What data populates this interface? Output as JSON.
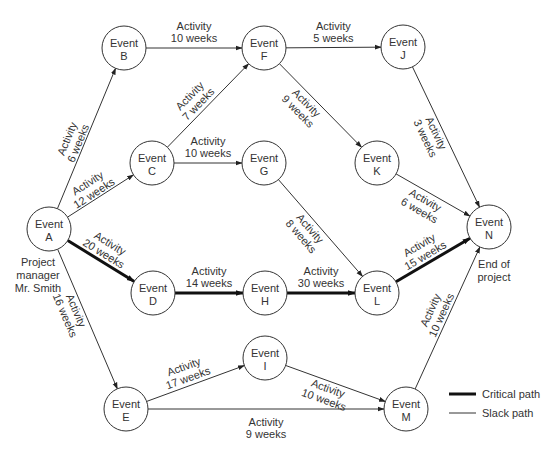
{
  "diagram": {
    "type": "PERT network",
    "colors": {
      "line": "#333333",
      "critical": "#111111",
      "background": "#ffffff"
    },
    "nodes": [
      {
        "id": "A",
        "line1": "Event",
        "line2": "A",
        "x": 49,
        "y": 229
      },
      {
        "id": "B",
        "line1": "Event",
        "line2": "B",
        "x": 124,
        "y": 48
      },
      {
        "id": "C",
        "line1": "Event",
        "line2": "C",
        "x": 152,
        "y": 163
      },
      {
        "id": "D",
        "line1": "Event",
        "line2": "D",
        "x": 153,
        "y": 293
      },
      {
        "id": "E",
        "line1": "Event",
        "line2": "E",
        "x": 126,
        "y": 409
      },
      {
        "id": "F",
        "line1": "Event",
        "line2": "F",
        "x": 264,
        "y": 48
      },
      {
        "id": "G",
        "line1": "Event",
        "line2": "G",
        "x": 264,
        "y": 163
      },
      {
        "id": "H",
        "line1": "Event",
        "line2": "H",
        "x": 265,
        "y": 293
      },
      {
        "id": "I",
        "line1": "Event",
        "line2": "I",
        "x": 265,
        "y": 358
      },
      {
        "id": "J",
        "line1": "Event",
        "line2": "J",
        "x": 403,
        "y": 47
      },
      {
        "id": "K",
        "line1": "Event",
        "line2": "K",
        "x": 377,
        "y": 163
      },
      {
        "id": "L",
        "line1": "Event",
        "line2": "L",
        "x": 377,
        "y": 293
      },
      {
        "id": "M",
        "line1": "Event",
        "line2": "M",
        "x": 406,
        "y": 409
      },
      {
        "id": "N",
        "line1": "Event",
        "line2": "N",
        "x": 489,
        "y": 227
      }
    ],
    "edges": [
      {
        "from": "A",
        "to": "B",
        "line1": "Activity",
        "line2": "6 weeks",
        "critical": false
      },
      {
        "from": "A",
        "to": "C",
        "line1": "Activity",
        "line2": "12 weeks",
        "critical": false
      },
      {
        "from": "A",
        "to": "D",
        "line1": "Activity",
        "line2": "20 weeks",
        "critical": true
      },
      {
        "from": "A",
        "to": "E",
        "line1": "Activity",
        "line2": "16 weeks",
        "critical": false
      },
      {
        "from": "B",
        "to": "F",
        "line1": "Activity",
        "line2": "10 weeks",
        "critical": false
      },
      {
        "from": "C",
        "to": "F",
        "line1": "Activity",
        "line2": "7 weeks",
        "critical": false
      },
      {
        "from": "C",
        "to": "G",
        "line1": "Activity",
        "line2": "10 weeks",
        "critical": false
      },
      {
        "from": "D",
        "to": "H",
        "line1": "Activity",
        "line2": "14 weeks",
        "critical": true
      },
      {
        "from": "E",
        "to": "I",
        "line1": "Activity",
        "line2": "17 weeks",
        "critical": false
      },
      {
        "from": "E",
        "to": "M",
        "line1": "Activity",
        "line2": "9 weeks",
        "critical": false
      },
      {
        "from": "F",
        "to": "J",
        "line1": "Activity",
        "line2": "5 weeks",
        "critical": false
      },
      {
        "from": "F",
        "to": "K",
        "line1": "Activity",
        "line2": "9 weeks",
        "critical": false
      },
      {
        "from": "G",
        "to": "L",
        "line1": "Activity",
        "line2": "8 weeks",
        "critical": false
      },
      {
        "from": "H",
        "to": "L",
        "line1": "Activity",
        "line2": "30 weeks",
        "critical": true
      },
      {
        "from": "I",
        "to": "M",
        "line1": "Activity",
        "line2": "10 weeks",
        "critical": false
      },
      {
        "from": "J",
        "to": "N",
        "line1": "Activity",
        "line2": "3 weeks",
        "critical": false
      },
      {
        "from": "K",
        "to": "N",
        "line1": "Activity",
        "line2": "6 weeks",
        "critical": false
      },
      {
        "from": "L",
        "to": "N",
        "line1": "Activity",
        "line2": "15 weeks",
        "critical": true
      },
      {
        "from": "M",
        "to": "N",
        "line1": "Activity",
        "line2": "10 weeks",
        "critical": false
      }
    ],
    "notes": {
      "start": {
        "line1": "Project",
        "line2": "manager",
        "line3": "Mr. Smith"
      },
      "end": {
        "line1": "End of",
        "line2": "project"
      }
    },
    "legend": {
      "critical": "Critical path",
      "slack": "Slack path"
    }
  }
}
